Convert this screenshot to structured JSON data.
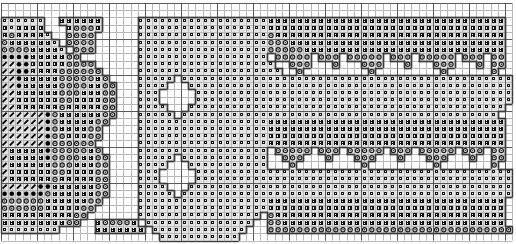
{
  "document": {
    "kind": "cross-stitch-pattern-chart",
    "title": "Cross Stitch Pattern Chart",
    "width_px": 516,
    "height_px": 244
  },
  "grid": {
    "cell_size_px": 7.2,
    "columns": 71,
    "rows": 33,
    "origin_x_px": 1,
    "origin_y_px": 3,
    "minor_line_color": "#b9b9b9",
    "major_line_color": "#3a3a3a",
    "major_every": 5,
    "background_color": "#ffffff",
    "cell_fill_color": "#e0e0e0",
    "symbol_color": "#1a1a1a"
  },
  "symbols": [
    {
      "key": "blank",
      "name": "empty-cell",
      "glyph": "",
      "fill": "#ffffff",
      "ink": "#ffffff"
    },
    {
      "key": "square",
      "name": "open-square-symbol",
      "glyph": "□",
      "fill": "#e3e3e3",
      "ink": "#151515"
    },
    {
      "key": "cross",
      "name": "x-cross-symbol",
      "glyph": "✕",
      "fill": "#dcdcdc",
      "ink": "#101010"
    },
    {
      "key": "circle",
      "name": "open-circle-symbol",
      "glyph": "◎",
      "fill": "#e6e6e6",
      "ink": "#1c1c1c"
    },
    {
      "key": "dot",
      "name": "filled-dot-symbol",
      "glyph": "●",
      "fill": "#d8d8d8",
      "ink": "#000000"
    },
    {
      "key": "slash",
      "name": "diagonal-slash-symbol",
      "glyph": "/",
      "fill": "#e2e2e2",
      "ink": "#000000"
    }
  ],
  "chart_data": {
    "type": "heatmap",
    "title": "Cross Stitch Pattern Chart",
    "xlabel": "",
    "ylabel": "",
    "grid": true,
    "legend": "none",
    "categories": [
      "blank",
      "square",
      "cross",
      "circle",
      "dot",
      "slash"
    ],
    "rows": 33,
    "columns": 71,
    "cells": [
      ".....................................................................b.",
      "....................................................................bb.",
      "ssssss..xxxxxx.....ssssssssssssssssssxxxxxxxxxxxxxxxxxxxxxxxxxxxxxxxxx.",
      "xsxxxx...xcccx.....ssssssssssssssssssxxxxxxxxxxxxxxxxxxxxxxxxxxxxxxxxx.",
      "xcxxxxs..cccc......sssssssssssssssssscxxxxxxxxxxxxxxxxxxxxxxxxxxxxxxxx.",
      "cxxxxxxs.cccc......sssssssssssssssssscccxxxxxxxxxxxxxxxxxxxxxxxxxxxxxx.",
      "ccccxxxxs.ccc......sssssssssssssssssscccccxxxxxxxxxxxxxxxxxxxxxxxxxxxx.",
      "ddddxxxxxcc........ssssssssssssssssss.ccccc.ccc.ccccc.ccc.ccccc.ccc.cc.",
      "//ddxxxxxcccc......sssssssssssssssssss..ccc...c...ccc...c...ccc...c.cc.",
      "//ddxxxxcccccc.....ssssssssssssssssssss..c.........c.........c......c..",
      "//dxxxxxcccccxc....sssss.ssssssssssssssssssssssssssssssssssssssssssssss",
      "//dxxxxxccccxxcc...ssss...ssssssssssssssssssssssssssssssssssssssssssssss",
      "//xxxxxxcccxxxcc...sss.....sssssssssssssssssssssssssssssssssssssssssssss",
      "//xxxxxxccxxxxcc...sss.....ssssssssssssssssssssssssssssssssssssssssssss",
      "//xxxxxxcxxxxxcc...ssss...ssssssssssssssssssssssssssssssssssssssssssss",
      "//////dcxxxxxxcc...sssss.ssssssssssssssssssssssssssssssssssssssssssss",
      "//////dcxxxxxcc....ssssssssssssssssssxxxxxxxxxxxxxxxxxxxxxxxxxxxxxxxxx",
      "//////dcxxxxcc.....ssssssssssssssssssxxxxxxxxxxxxxxxxxxxxxxxxxxxxxxxxx",
      "//////dccxxxcc.....ssssssssssssssssssxxxxxxxxxxxxxxxxxxxxxxxxxxxxxxxxx",
      "//////dcccccc......ssssssssssssssssssxxxxxxxxxxxxxxxxxxxxxxxxxxxxxxxxx",
      "/xxxxxdcccccxc.....ssssssssssssssssss.ccccc.ccc.ccccc.ccc.ccccc.ccc.cc",
      "/xxxxxdccccxxcc....sssss.ssssssssssss..ccc...c...ccc...c...ccc...c..cc",
      "/xxxxxxcccxxxcc....ssss...sssssssssss...c.........c.........c.......c.",
      "/xxxxxxccxxxxcc....sss.....ssssssssssssssssssssssssssssssssssssssssssss",
      "/xxxxxxcxxxxxcc....sss.....ssssssssssssssssssssssssssssssssssssssssssss",
      "/////ddxxxxxxcc....ssss...sssssssssssssssssssssssssssssssssssssssssssss",
      "ddddddcxxxxxxcc....sssss.ssssssssssssssssssssssssssssssssssssssssssssss",
      "ccccccxxxxxxcc.....ssssssssssssssssssxxxxxxxxxxxxxxxxxxxxxxxxxxxxxxxxx",
      "ccccccxxxxxcc......ssssssssssssssssssxxxxxxxxxxxxxxxxxxxxxxxxxxxxxxxxx",
      "xxxxxxxxxxcc.......sssssssssssssssss.cxxxxxxxxxxxxxxxxxxxxxxxxxxxxxxxx",
      "xxxxxxxxxcc..xccccx.sssssssssssssss..ccxxxxxxxxxxxxxxxxxxxxxxxxxxxxxxx",
      "ssssssss.....xxxxxxx.sssssssssssss...cccccccccccccccccccccccccccccccccc",
      "......................sssssssssss....................................."
    ],
    "legend_entries": [
      {
        "symbol": "□",
        "name": "open-square-symbol",
        "count_estimate": 980
      },
      {
        "symbol": "✕",
        "name": "x-cross-symbol",
        "count_estimate": 760
      },
      {
        "symbol": "◎",
        "name": "open-circle-symbol",
        "count_estimate": 300
      },
      {
        "symbol": "●",
        "name": "filled-dot-symbol",
        "count_estimate": 46
      },
      {
        "symbol": "/",
        "name": "diagonal-slash-symbol",
        "count_estimate": 60
      }
    ]
  }
}
